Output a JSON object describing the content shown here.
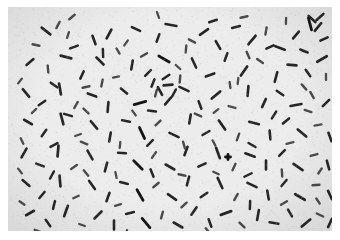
{
  "image": {
    "kind": "photomicrograph",
    "subject": "rod-shaped bacteria (bacilli)",
    "stain_appearance": "dark rods on pale gray field",
    "width_px": 340,
    "height_px": 240
  },
  "canvas": {
    "outer_background": "#ffffff",
    "field_background": "#ececec",
    "field_background_edge": "#e2e2e2",
    "field_x": 8,
    "field_y": 7,
    "field_width": 324,
    "field_height": 224,
    "margin_top": 7,
    "margin_left": 8,
    "margin_right": 8,
    "margin_bottom": 9
  },
  "appearance": {
    "cell_color": "#262626",
    "cell_color_light": "#4a4a4a",
    "cell_color_dark": "#141414",
    "speckle_color": "#b9b9b9",
    "cell_count": 214,
    "cell_length_min_px": 5,
    "cell_length_max_px": 16,
    "cell_width_px": 2.6
  },
  "chart_data": {
    "type": "scatter",
    "title": "",
    "xlabel": "",
    "ylabel": "",
    "xlim": [
      0,
      324
    ],
    "ylim": [
      0,
      224
    ],
    "grid": false,
    "legend": null,
    "note": "Each datum is one bacillus: x, y = centroid in field pixels; len = rod length px; ang = orientation degrees; w = rod thickness px; c = darkness class",
    "fields": [
      "x",
      "y",
      "len",
      "ang",
      "w",
      "c"
    ],
    "cells": [
      [
        38,
        24,
        11,
        38,
        2.6,
        0
      ],
      [
        50,
        18,
        7,
        -62,
        2.4,
        1
      ],
      [
        86,
        33,
        9,
        70,
        2.6,
        0
      ],
      [
        66,
        40,
        8,
        -20,
        2.5,
        0
      ],
      [
        101,
        27,
        10,
        118,
        2.7,
        0
      ],
      [
        118,
        36,
        6,
        -55,
        2.3,
        1
      ],
      [
        128,
        22,
        9,
        25,
        2.6,
        0
      ],
      [
        150,
        31,
        8,
        -70,
        2.5,
        0
      ],
      [
        163,
        18,
        11,
        10,
        2.7,
        0
      ],
      [
        178,
        42,
        7,
        95,
        2.4,
        1
      ],
      [
        196,
        25,
        10,
        -35,
        2.6,
        0
      ],
      [
        210,
        38,
        9,
        60,
        2.6,
        0
      ],
      [
        228,
        20,
        8,
        -15,
        2.5,
        0
      ],
      [
        244,
        33,
        11,
        130,
        2.7,
        0
      ],
      [
        258,
        24,
        7,
        -80,
        2.4,
        1
      ],
      [
        272,
        41,
        10,
        20,
        2.6,
        0
      ],
      [
        288,
        28,
        9,
        -50,
        2.6,
        0
      ],
      [
        302,
        17,
        12,
        75,
        2.8,
        2
      ],
      [
        316,
        32,
        8,
        -25,
        2.5,
        0
      ],
      [
        310,
        20,
        10,
        130,
        2.6,
        0
      ],
      [
        22,
        55,
        9,
        -40,
        2.6,
        0
      ],
      [
        40,
        62,
        7,
        85,
        2.4,
        1
      ],
      [
        58,
        50,
        11,
        15,
        2.7,
        0
      ],
      [
        74,
        68,
        8,
        -65,
        2.5,
        0
      ],
      [
        92,
        54,
        10,
        45,
        2.6,
        0
      ],
      [
        108,
        70,
        6,
        -10,
        2.3,
        1
      ],
      [
        124,
        58,
        9,
        100,
        2.6,
        0
      ],
      [
        140,
        66,
        8,
        -45,
        2.5,
        0
      ],
      [
        156,
        52,
        12,
        30,
        2.8,
        2
      ],
      [
        172,
        72,
        7,
        -85,
        2.4,
        1
      ],
      [
        186,
        56,
        10,
        65,
        2.6,
        0
      ],
      [
        202,
        68,
        9,
        -20,
        2.6,
        0
      ],
      [
        218,
        50,
        8,
        110,
        2.5,
        0
      ],
      [
        236,
        64,
        11,
        -55,
        2.7,
        0
      ],
      [
        252,
        54,
        7,
        35,
        2.4,
        1
      ],
      [
        268,
        70,
        10,
        -75,
        2.6,
        0
      ],
      [
        284,
        58,
        9,
        5,
        2.6,
        0
      ],
      [
        300,
        66,
        8,
        55,
        2.5,
        0
      ],
      [
        314,
        52,
        11,
        -30,
        2.7,
        0
      ],
      [
        318,
        70,
        6,
        90,
        2.3,
        1
      ],
      [
        18,
        86,
        10,
        50,
        2.6,
        0
      ],
      [
        34,
        96,
        8,
        -35,
        2.5,
        0
      ],
      [
        52,
        82,
        11,
        80,
        2.7,
        0
      ],
      [
        68,
        98,
        7,
        -60,
        2.4,
        1
      ],
      [
        84,
        88,
        9,
        20,
        2.6,
        0
      ],
      [
        100,
        100,
        10,
        -85,
        2.6,
        0
      ],
      [
        116,
        84,
        8,
        40,
        2.5,
        0
      ],
      [
        132,
        96,
        12,
        -15,
        2.8,
        2
      ],
      [
        148,
        86,
        7,
        105,
        2.4,
        1
      ],
      [
        160,
        94,
        9,
        -50,
        2.6,
        0
      ],
      [
        176,
        82,
        10,
        25,
        2.6,
        0
      ],
      [
        192,
        98,
        8,
        70,
        2.5,
        0
      ],
      [
        208,
        88,
        11,
        -40,
        2.7,
        0
      ],
      [
        224,
        100,
        7,
        15,
        2.4,
        1
      ],
      [
        240,
        84,
        10,
        95,
        2.6,
        0
      ],
      [
        256,
        96,
        9,
        -65,
        2.6,
        0
      ],
      [
        272,
        86,
        8,
        35,
        2.5,
        0
      ],
      [
        288,
        98,
        11,
        -10,
        2.7,
        0
      ],
      [
        304,
        88,
        7,
        60,
        2.4,
        1
      ],
      [
        318,
        96,
        9,
        -45,
        2.6,
        0
      ],
      [
        20,
        115,
        9,
        30,
        2.6,
        0
      ],
      [
        36,
        126,
        8,
        -55,
        2.5,
        0
      ],
      [
        54,
        112,
        11,
        75,
        2.7,
        0
      ],
      [
        70,
        128,
        6,
        -20,
        2.3,
        1
      ],
      [
        86,
        118,
        10,
        50,
        2.6,
        0
      ],
      [
        102,
        130,
        9,
        -80,
        2.6,
        0
      ],
      [
        118,
        114,
        8,
        10,
        2.5,
        0
      ],
      [
        134,
        126,
        12,
        65,
        2.8,
        2
      ],
      [
        150,
        116,
        7,
        -45,
        2.4,
        1
      ],
      [
        166,
        128,
        10,
        25,
        2.6,
        0
      ],
      [
        182,
        112,
        9,
        100,
        2.6,
        0
      ],
      [
        198,
        126,
        8,
        -30,
        2.5,
        0
      ],
      [
        214,
        118,
        11,
        55,
        2.7,
        0
      ],
      [
        230,
        130,
        7,
        -70,
        2.4,
        1
      ],
      [
        246,
        116,
        10,
        15,
        2.6,
        0
      ],
      [
        262,
        128,
        9,
        85,
        2.6,
        0
      ],
      [
        278,
        114,
        8,
        -40,
        2.5,
        0
      ],
      [
        294,
        126,
        11,
        40,
        2.7,
        0
      ],
      [
        310,
        118,
        7,
        -10,
        2.4,
        1
      ],
      [
        322,
        130,
        9,
        70,
        2.6,
        0
      ],
      [
        16,
        146,
        10,
        -60,
        2.6,
        0
      ],
      [
        32,
        158,
        8,
        20,
        2.5,
        0
      ],
      [
        50,
        144,
        11,
        95,
        2.7,
        0
      ],
      [
        66,
        160,
        7,
        -35,
        2.4,
        1
      ],
      [
        82,
        148,
        10,
        60,
        2.6,
        0
      ],
      [
        98,
        160,
        9,
        -75,
        2.6,
        0
      ],
      [
        114,
        146,
        8,
        5,
        2.5,
        0
      ],
      [
        130,
        158,
        12,
        45,
        2.8,
        2
      ],
      [
        146,
        148,
        7,
        -55,
        2.4,
        1
      ],
      [
        162,
        160,
        10,
        30,
        2.6,
        0
      ],
      [
        178,
        144,
        9,
        110,
        2.6,
        0
      ],
      [
        194,
        158,
        8,
        -25,
        2.5,
        0
      ],
      [
        210,
        146,
        11,
        70,
        2.7,
        0
      ],
      [
        226,
        160,
        7,
        -65,
        2.4,
        1
      ],
      [
        242,
        148,
        10,
        20,
        2.6,
        0
      ],
      [
        258,
        158,
        9,
        90,
        2.6,
        0
      ],
      [
        274,
        146,
        8,
        -45,
        2.5,
        0
      ],
      [
        290,
        160,
        11,
        35,
        2.7,
        0
      ],
      [
        306,
        148,
        7,
        -15,
        2.4,
        1
      ],
      [
        320,
        158,
        9,
        75,
        2.6,
        0
      ],
      [
        18,
        176,
        9,
        40,
        2.6,
        0
      ],
      [
        34,
        188,
        8,
        -50,
        2.5,
        0
      ],
      [
        52,
        174,
        11,
        85,
        2.7,
        0
      ],
      [
        68,
        190,
        6,
        -25,
        2.3,
        1
      ],
      [
        84,
        178,
        10,
        55,
        2.6,
        0
      ],
      [
        100,
        190,
        9,
        -70,
        2.6,
        0
      ],
      [
        116,
        176,
        8,
        15,
        2.5,
        0
      ],
      [
        132,
        188,
        12,
        60,
        2.8,
        2
      ],
      [
        148,
        178,
        7,
        -40,
        2.4,
        1
      ],
      [
        164,
        190,
        10,
        35,
        2.6,
        0
      ],
      [
        180,
        174,
        9,
        105,
        2.6,
        0
      ],
      [
        196,
        188,
        8,
        -35,
        2.5,
        0
      ],
      [
        212,
        176,
        11,
        65,
        2.7,
        0
      ],
      [
        228,
        190,
        7,
        -60,
        2.4,
        1
      ],
      [
        244,
        178,
        10,
        25,
        2.6,
        0
      ],
      [
        260,
        188,
        9,
        80,
        2.6,
        0
      ],
      [
        276,
        176,
        8,
        -50,
        2.5,
        0
      ],
      [
        292,
        190,
        11,
        30,
        2.7,
        0
      ],
      [
        308,
        178,
        7,
        -5,
        2.4,
        1
      ],
      [
        322,
        188,
        9,
        65,
        2.6,
        0
      ],
      [
        22,
        206,
        9,
        -30,
        2.6,
        0
      ],
      [
        40,
        216,
        8,
        55,
        2.5,
        0
      ],
      [
        58,
        204,
        11,
        -70,
        2.7,
        0
      ],
      [
        74,
        218,
        6,
        20,
        2.3,
        1
      ],
      [
        90,
        208,
        10,
        -45,
        2.6,
        0
      ],
      [
        106,
        218,
        9,
        90,
        2.6,
        0
      ],
      [
        122,
        206,
        8,
        -15,
        2.5,
        0
      ],
      [
        138,
        216,
        12,
        50,
        2.8,
        2
      ],
      [
        154,
        208,
        7,
        -75,
        2.4,
        1
      ],
      [
        170,
        218,
        10,
        30,
        2.6,
        0
      ],
      [
        186,
        204,
        9,
        -55,
        2.6,
        0
      ],
      [
        202,
        216,
        8,
        70,
        2.5,
        0
      ],
      [
        218,
        206,
        11,
        -20,
        2.7,
        0
      ],
      [
        234,
        218,
        7,
        45,
        2.4,
        1
      ],
      [
        250,
        208,
        10,
        -80,
        2.6,
        0
      ],
      [
        266,
        216,
        9,
        10,
        2.6,
        0
      ],
      [
        282,
        206,
        8,
        60,
        2.5,
        0
      ],
      [
        298,
        216,
        11,
        -40,
        2.7,
        0
      ],
      [
        312,
        208,
        7,
        25,
        2.4,
        1
      ],
      [
        322,
        216,
        9,
        -65,
        2.6,
        0
      ],
      [
        28,
        38,
        7,
        12,
        2.4,
        1
      ],
      [
        60,
        28,
        6,
        -72,
        2.3,
        1
      ],
      [
        95,
        46,
        8,
        88,
        2.5,
        0
      ],
      [
        136,
        48,
        7,
        -30,
        2.4,
        1
      ],
      [
        170,
        60,
        6,
        42,
        2.3,
        1
      ],
      [
        205,
        14,
        8,
        -18,
        2.5,
        0
      ],
      [
        240,
        48,
        7,
        66,
        2.4,
        1
      ],
      [
        278,
        14,
        6,
        -88,
        2.3,
        1
      ],
      [
        296,
        44,
        8,
        22,
        2.5,
        0
      ],
      [
        12,
        74,
        6,
        -52,
        2.3,
        1
      ],
      [
        46,
        78,
        8,
        36,
        2.5,
        0
      ],
      [
        78,
        80,
        7,
        -12,
        2.4,
        1
      ],
      [
        110,
        44,
        6,
        58,
        2.3,
        1
      ],
      [
        145,
        76,
        8,
        -68,
        2.5,
        0
      ],
      [
        184,
        34,
        7,
        28,
        2.4,
        1
      ],
      [
        222,
        78,
        6,
        82,
        2.3,
        1
      ],
      [
        262,
        40,
        8,
        -24,
        2.5,
        0
      ],
      [
        296,
        80,
        7,
        48,
        2.4,
        1
      ],
      [
        26,
        104,
        6,
        -44,
        2.3,
        1
      ],
      [
        60,
        108,
        8,
        16,
        2.5,
        0
      ],
      [
        94,
        76,
        7,
        -78,
        2.4,
        1
      ],
      [
        126,
        106,
        6,
        54,
        2.3,
        1
      ],
      [
        158,
        70,
        8,
        -34,
        2.5,
        0
      ],
      [
        190,
        108,
        7,
        24,
        2.4,
        1
      ],
      [
        230,
        74,
        6,
        96,
        2.3,
        1
      ],
      [
        266,
        108,
        8,
        -58,
        2.5,
        0
      ],
      [
        300,
        104,
        7,
        18,
        2.4,
        1
      ],
      [
        14,
        134,
        6,
        64,
        2.3,
        1
      ],
      [
        46,
        138,
        8,
        -28,
        2.5,
        0
      ],
      [
        78,
        104,
        7,
        44,
        2.4,
        1
      ],
      [
        112,
        138,
        6,
        -84,
        2.3,
        1
      ],
      [
        144,
        104,
        8,
        8,
        2.5,
        0
      ],
      [
        176,
        138,
        7,
        74,
        2.4,
        1
      ],
      [
        208,
        104,
        6,
        -38,
        2.3,
        1
      ],
      [
        244,
        138,
        8,
        30,
        2.5,
        0
      ],
      [
        282,
        136,
        7,
        -14,
        2.4,
        1
      ],
      [
        12,
        164,
        6,
        52,
        2.3,
        1
      ],
      [
        44,
        168,
        8,
        -62,
        2.5,
        0
      ],
      [
        76,
        136,
        7,
        22,
        2.4,
        1
      ],
      [
        108,
        168,
        6,
        78,
        2.3,
        1
      ],
      [
        142,
        136,
        8,
        -46,
        2.5,
        0
      ],
      [
        174,
        168,
        7,
        12,
        2.4,
        1
      ],
      [
        206,
        136,
        6,
        62,
        2.3,
        1
      ],
      [
        240,
        168,
        8,
        -26,
        2.5,
        0
      ],
      [
        274,
        166,
        7,
        86,
        2.4,
        1
      ],
      [
        312,
        164,
        6,
        -56,
        2.3,
        1
      ],
      [
        14,
        196,
        6,
        34,
        2.3,
        1
      ],
      [
        46,
        198,
        8,
        -76,
        2.5,
        0
      ],
      [
        78,
        166,
        7,
        50,
        2.4,
        1
      ],
      [
        110,
        198,
        6,
        -16,
        2.3,
        1
      ],
      [
        144,
        166,
        8,
        68,
        2.5,
        0
      ],
      [
        176,
        198,
        7,
        -42,
        2.4,
        1
      ],
      [
        208,
        166,
        6,
        26,
        2.3,
        1
      ],
      [
        242,
        198,
        8,
        92,
        2.5,
        0
      ],
      [
        276,
        196,
        7,
        -32,
        2.4,
        1
      ],
      [
        310,
        194,
        6,
        56,
        2.3,
        1
      ],
      [
        160,
        78,
        9,
        -5,
        2.6,
        0
      ],
      [
        152,
        84,
        9,
        62,
        2.6,
        0
      ],
      [
        166,
        86,
        8,
        -62,
        2.5,
        0
      ],
      [
        304,
        12,
        9,
        42,
        2.6,
        0
      ],
      [
        312,
        10,
        9,
        -42,
        2.6,
        0
      ],
      [
        220,
        150,
        5,
        0,
        2.8,
        2
      ],
      [
        220,
        150,
        5,
        90,
        2.8,
        2
      ],
      [
        30,
        224,
        7,
        20,
        2.4,
        1
      ],
      [
        118,
        226,
        6,
        -70,
        2.3,
        1
      ],
      [
        200,
        224,
        7,
        50,
        2.4,
        1
      ],
      [
        64,
        10,
        7,
        -40,
        2.4,
        1
      ],
      [
        150,
        8,
        6,
        70,
        2.3,
        1
      ],
      [
        236,
        10,
        7,
        -12,
        2.4,
        1
      ]
    ]
  }
}
